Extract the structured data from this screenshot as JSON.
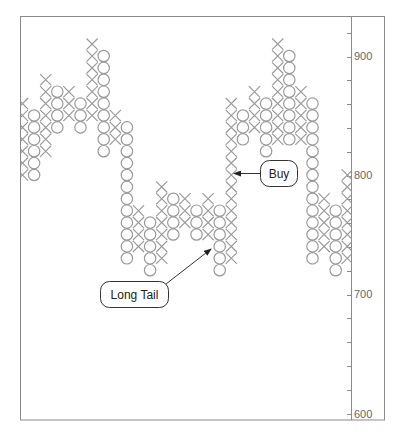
{
  "chart_data": {
    "type": "point_and_figure",
    "title": "",
    "xlabel": "",
    "ylabel": "",
    "box_size": 10,
    "ylim": [
      600,
      930
    ],
    "y_ticks": [
      600,
      700,
      800,
      900
    ],
    "y_minor_tick_step": 20,
    "y_axis_position": "right",
    "grid": false,
    "legend": null,
    "columns": [
      {
        "type": "X",
        "high": 860,
        "low": 800
      },
      {
        "type": "O",
        "high": 850,
        "low": 800
      },
      {
        "type": "X",
        "high": 880,
        "low": 820
      },
      {
        "type": "O",
        "high": 870,
        "low": 840
      },
      {
        "type": "X",
        "high": 870,
        "low": 850
      },
      {
        "type": "O",
        "high": 860,
        "low": 840
      },
      {
        "type": "X",
        "high": 910,
        "low": 850
      },
      {
        "type": "O",
        "high": 900,
        "low": 820
      },
      {
        "type": "X",
        "high": 850,
        "low": 830
      },
      {
        "type": "O",
        "high": 840,
        "low": 730
      },
      {
        "type": "X",
        "high": 770,
        "low": 740
      },
      {
        "type": "O",
        "high": 760,
        "low": 720
      },
      {
        "type": "X",
        "high": 790,
        "low": 730
      },
      {
        "type": "O",
        "high": 780,
        "low": 750
      },
      {
        "type": "X",
        "high": 780,
        "low": 760
      },
      {
        "type": "O",
        "high": 770,
        "low": 750
      },
      {
        "type": "X",
        "high": 780,
        "low": 750
      },
      {
        "type": "O",
        "high": 770,
        "low": 720
      },
      {
        "type": "X",
        "high": 860,
        "low": 730
      },
      {
        "type": "O",
        "high": 850,
        "low": 830
      },
      {
        "type": "X",
        "high": 870,
        "low": 840
      },
      {
        "type": "O",
        "high": 860,
        "low": 820
      },
      {
        "type": "X",
        "high": 910,
        "low": 830
      },
      {
        "type": "O",
        "high": 900,
        "low": 830
      },
      {
        "type": "X",
        "high": 870,
        "low": 830
      },
      {
        "type": "O",
        "high": 860,
        "low": 730
      },
      {
        "type": "X",
        "high": 780,
        "low": 740
      },
      {
        "type": "O",
        "high": 770,
        "low": 720
      },
      {
        "type": "X",
        "high": 800,
        "low": 730
      }
    ],
    "annotations": [
      {
        "text": "Buy",
        "target_column": 19,
        "target_price": 800
      },
      {
        "text": "Long Tail",
        "target_column": 18,
        "target_price": 740
      }
    ]
  },
  "colors": {
    "frame": "#8a8a8a",
    "symbol": "#9a9a9a",
    "axis_text": "#666666",
    "callout": "#333333"
  },
  "labels": {
    "buy": "Buy",
    "long_tail": "Long Tail",
    "tick_900": "900",
    "tick_800": "800",
    "tick_700": "700",
    "tick_600": "600"
  }
}
